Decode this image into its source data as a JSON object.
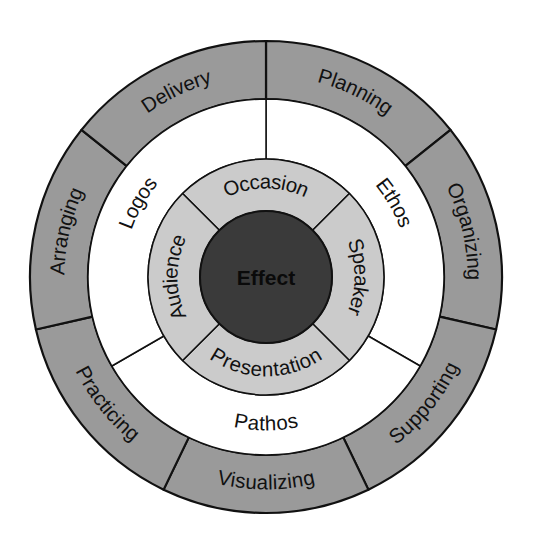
{
  "diagram": {
    "geometry": {
      "center_x": 266,
      "center_y": 277,
      "outer_radius": 236,
      "outer_ring_inner_radius": 178,
      "middle_ring_inner_radius": 118,
      "core_radius": 66
    },
    "colors": {
      "outer_ring_fill": "#9a9a9a",
      "middle_ring_fill": "#ffffff",
      "inner_ring_fill": "#cbcbcb",
      "core_fill": "#3a3a3a",
      "stroke": "#111111",
      "label_text": "#111111",
      "core_text": "#0a0a0a",
      "background": "#ffffff"
    },
    "core": {
      "label": "Effect"
    },
    "inner_ring": {
      "name": "canons-audience-ring",
      "segments": [
        {
          "label": "Occasion",
          "position": "top",
          "start_deg": -45,
          "end_deg": 45
        },
        {
          "label": "Speaker",
          "position": "right",
          "start_deg": 45,
          "end_deg": 135
        },
        {
          "label": "Presentation",
          "position": "bottom",
          "start_deg": 135,
          "end_deg": 225
        },
        {
          "label": "Audience",
          "position": "left",
          "start_deg": 225,
          "end_deg": 315
        }
      ]
    },
    "middle_ring": {
      "name": "appeals-ring",
      "segments": [
        {
          "label": "Ethos",
          "position": "right",
          "start_deg": 0,
          "end_deg": 120
        },
        {
          "label": "Pathos",
          "position": "bottom",
          "start_deg": 120,
          "end_deg": 240
        },
        {
          "label": "Logos",
          "position": "left",
          "start_deg": 240,
          "end_deg": 360
        }
      ]
    },
    "outer_ring": {
      "name": "process-ring",
      "segments": [
        {
          "label": "Planning",
          "start_deg": 0,
          "end_deg": 51.43
        },
        {
          "label": "Organizing",
          "start_deg": 51.43,
          "end_deg": 102.86
        },
        {
          "label": "Supporting",
          "start_deg": 102.86,
          "end_deg": 154.29
        },
        {
          "label": "Visualizing",
          "start_deg": 154.29,
          "end_deg": 205.71
        },
        {
          "label": "Practicing",
          "start_deg": 205.71,
          "end_deg": 257.14
        },
        {
          "label": "Arranging",
          "start_deg": 257.14,
          "end_deg": 308.57
        },
        {
          "label": "Delivery",
          "start_deg": 308.57,
          "end_deg": 360
        }
      ]
    }
  }
}
